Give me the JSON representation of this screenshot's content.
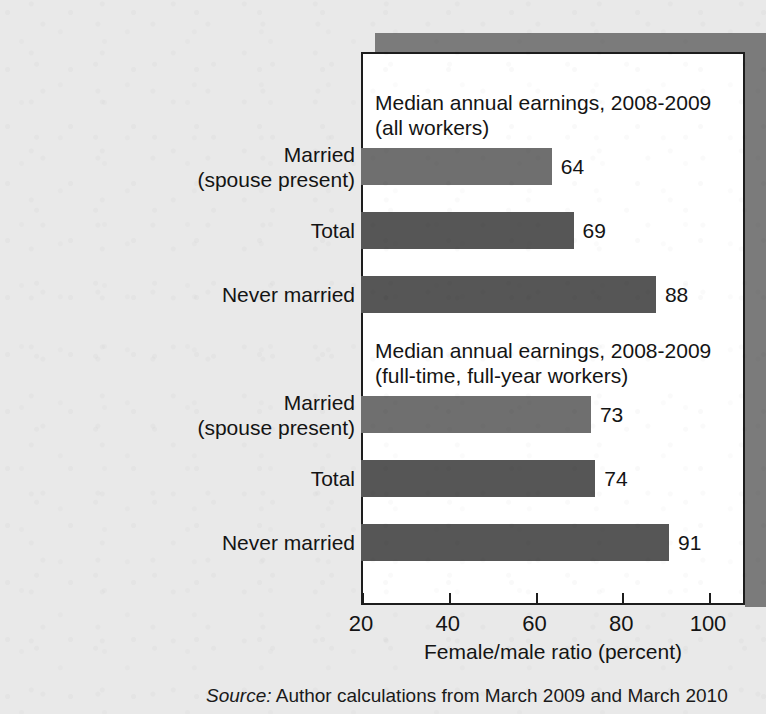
{
  "colors": {
    "page_background": "#e9e9e9",
    "panel_background": "#ffffff",
    "panel_border": "#1d1d1d",
    "panel_shadow": "#7b7b7b",
    "bar_light": "#6f6f6f",
    "bar_dark": "#565656",
    "text": "#141414"
  },
  "axis": {
    "title": "Female/male ratio (percent)",
    "ticks": [
      {
        "label": "20",
        "value": 20
      },
      {
        "label": "40",
        "value": 40
      },
      {
        "label": "60",
        "value": 60
      },
      {
        "label": "80",
        "value": 80
      },
      {
        "label": "100",
        "value": 100
      }
    ],
    "min": 20,
    "max": 100
  },
  "groups": [
    {
      "heading": "Median annual earnings, 2008-2009\n(all workers)",
      "bars": [
        {
          "category": "Married\n(spouse present)",
          "value": 64,
          "value_label": "64",
          "shade": "light"
        },
        {
          "category": "Total",
          "value": 69,
          "value_label": "69",
          "shade": "dark"
        },
        {
          "category": "Never married",
          "value": 88,
          "value_label": "88",
          "shade": "dark"
        }
      ]
    },
    {
      "heading": "Median annual earnings, 2008-2009\n(full-time, full-year workers)",
      "bars": [
        {
          "category": "Married\n(spouse present)",
          "value": 73,
          "value_label": "73",
          "shade": "light"
        },
        {
          "category": "Total",
          "value": 74,
          "value_label": "74",
          "shade": "dark"
        },
        {
          "category": "Never married",
          "value": 91,
          "value_label": "91",
          "shade": "dark"
        }
      ]
    }
  ],
  "source": {
    "keyword": "Source:",
    "text": " Author calculations from March 2009 and March 2010"
  },
  "chart_data": {
    "type": "bar",
    "orientation": "horizontal",
    "title": "",
    "xlabel": "Female/male ratio (percent)",
    "ylabel": "",
    "xlim": [
      20,
      100
    ],
    "xticks": [
      20,
      40,
      60,
      80,
      100
    ],
    "grid": false,
    "legend": "none",
    "categories": [
      "Married (spouse present) — all workers",
      "Total — all workers",
      "Never married — all workers",
      "Married (spouse present) — full-time, full-year workers",
      "Total — full-time, full-year workers",
      "Never married — full-time, full-year workers"
    ],
    "values": [
      64,
      69,
      88,
      73,
      74,
      91
    ],
    "panels": [
      {
        "heading": "Median annual earnings, 2008-2009 (all workers)",
        "categories": [
          "Married (spouse present)",
          "Total",
          "Never married"
        ],
        "values": [
          64,
          69,
          88
        ]
      },
      {
        "heading": "Median annual earnings, 2008-2009 (full-time, full-year workers)",
        "categories": [
          "Married (spouse present)",
          "Total",
          "Never married"
        ],
        "values": [
          73,
          74,
          91
        ]
      }
    ],
    "annotations": [
      "64",
      "69",
      "88",
      "73",
      "74",
      "91"
    ],
    "source": "Source: Author calculations from March 2009 and March 2010"
  }
}
